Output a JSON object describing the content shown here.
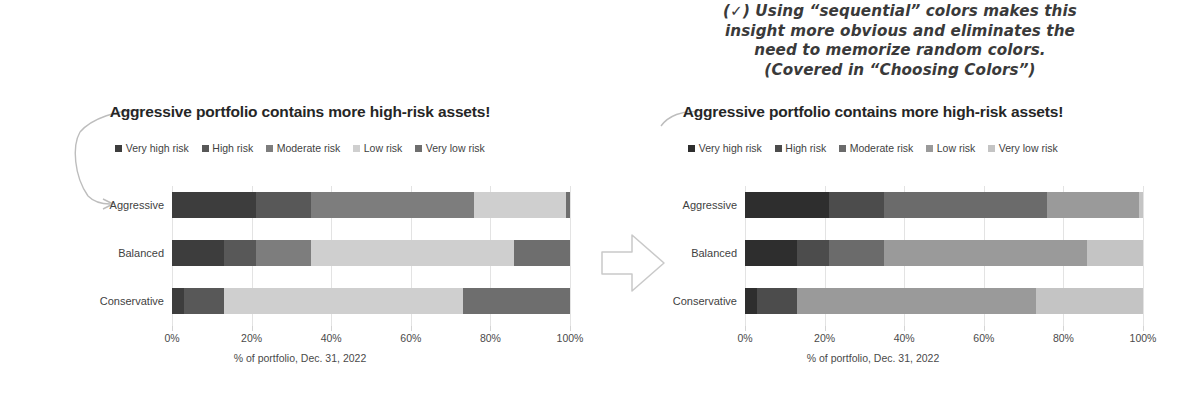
{
  "annotation": {
    "lines": [
      "(✓) Using “sequential” colors makes this",
      "insight more obvious and eliminates the",
      "need to memorize random colors.",
      "(Covered in “Choosing Colors”)"
    ]
  },
  "shared": {
    "title": "Aggressive portfolio contains more high-risk assets!",
    "xlabel": "% of portfolio, Dec. 31, 2022",
    "categories": [
      "Aggressive",
      "Balanced",
      "Conservative"
    ],
    "legend": [
      "Very high risk",
      "High risk",
      "Moderate risk",
      "Low risk",
      "Very low risk"
    ],
    "ticks": [
      "0%",
      "20%",
      "40%",
      "60%",
      "80%",
      "100%"
    ]
  },
  "palettes": {
    "random": [
      "#3d3d3d",
      "#585858",
      "#7d7d7d",
      "#cfcfcf",
      "#6e6e6e"
    ],
    "sequential": [
      "#2e2e2e",
      "#4c4c4c",
      "#6b6b6b",
      "#9a9a9a",
      "#c4c4c4"
    ]
  },
  "block_arrow": {
    "label": "right-block-arrow",
    "stroke": "#c9c9c9"
  },
  "chart_data": [
    {
      "type": "bar",
      "subtype": "stacked-horizontal-100pct",
      "id": "left-random-colors",
      "title": "Aggressive portfolio contains more high-risk assets!",
      "xlabel": "% of portfolio, Dec. 31, 2022",
      "ylabel": "",
      "categories": [
        "Aggressive",
        "Balanced",
        "Conservative"
      ],
      "xlim": [
        0,
        100
      ],
      "grid": true,
      "legend_position": "top",
      "colors_note": "random (non-sequential) color assignment",
      "series": [
        {
          "name": "Very high risk",
          "color": "#3d3d3d",
          "values": [
            21,
            13,
            3
          ]
        },
        {
          "name": "High risk",
          "color": "#585858",
          "values": [
            14,
            8,
            10
          ]
        },
        {
          "name": "Moderate risk",
          "color": "#7d7d7d",
          "values": [
            41,
            14,
            0
          ]
        },
        {
          "name": "Low risk",
          "color": "#cfcfcf",
          "values": [
            23,
            51,
            60
          ]
        },
        {
          "name": "Very low risk",
          "color": "#6e6e6e",
          "values": [
            1,
            14,
            27
          ]
        }
      ]
    },
    {
      "type": "bar",
      "subtype": "stacked-horizontal-100pct",
      "id": "right-sequential-colors",
      "title": "Aggressive portfolio contains more high-risk assets!",
      "xlabel": "% of portfolio, Dec. 31, 2022",
      "ylabel": "",
      "categories": [
        "Aggressive",
        "Balanced",
        "Conservative"
      ],
      "xlim": [
        0,
        100
      ],
      "grid": true,
      "legend_position": "top",
      "colors_note": "sequential dark-to-light color assignment",
      "series": [
        {
          "name": "Very high risk",
          "color": "#2e2e2e",
          "values": [
            21,
            13,
            3
          ]
        },
        {
          "name": "High risk",
          "color": "#4c4c4c",
          "values": [
            14,
            8,
            10
          ]
        },
        {
          "name": "Moderate risk",
          "color": "#6b6b6b",
          "values": [
            41,
            14,
            0
          ]
        },
        {
          "name": "Low risk",
          "color": "#9a9a9a",
          "values": [
            23,
            51,
            60
          ]
        },
        {
          "name": "Very low risk",
          "color": "#c4c4c4",
          "values": [
            1,
            14,
            27
          ]
        }
      ]
    }
  ]
}
